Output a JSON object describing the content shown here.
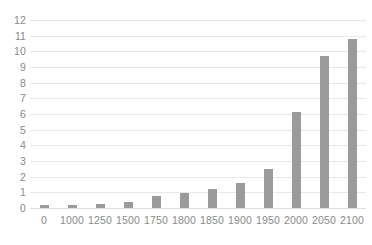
{
  "chart_data": {
    "type": "bar",
    "title": "",
    "subtitle": "",
    "xlabel": "",
    "ylabel": "",
    "categories": [
      "0",
      "1000",
      "1250",
      "1500",
      "1750",
      "1800",
      "1850",
      "1900",
      "1950",
      "2000",
      "2050",
      "2100"
    ],
    "values": [
      0.2,
      0.22,
      0.28,
      0.4,
      0.75,
      0.95,
      1.2,
      1.6,
      2.5,
      6.1,
      9.7,
      10.8
    ],
    "ylim": [
      0,
      12
    ],
    "ytick_labels": [
      "12",
      "11",
      "10",
      "9",
      "8",
      "7",
      "6",
      "5",
      "4",
      "3",
      "2",
      "1",
      "0"
    ],
    "ytick_values": [
      12,
      11,
      10,
      9,
      8,
      7,
      6,
      5,
      4,
      3,
      2,
      1,
      0
    ],
    "grid": true,
    "legend": false,
    "legend_position": "none",
    "colors": {
      "bar": "#9b9b9b",
      "gridline": "#e8e8e8",
      "baseline": "#dedede",
      "tick_label": "#8a8a8a",
      "background": "#ffffff"
    }
  }
}
